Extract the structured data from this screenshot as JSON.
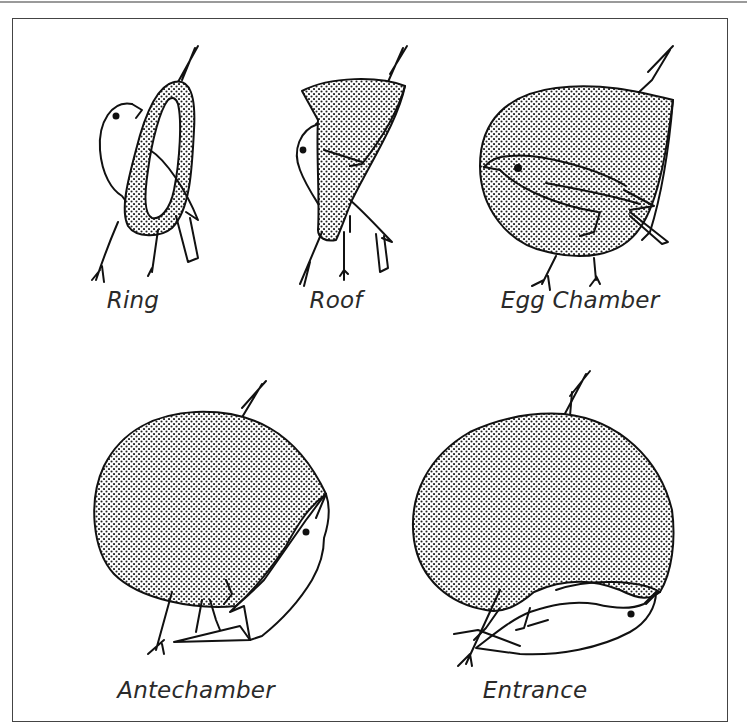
{
  "figure": {
    "panels": [
      {
        "id": "ring",
        "label": "Ring"
      },
      {
        "id": "roof",
        "label": "Roof"
      },
      {
        "id": "egg-chamber",
        "label": "Egg Chamber"
      },
      {
        "id": "antechamber",
        "label": "Antechamber"
      },
      {
        "id": "entrance",
        "label": "Entrance"
      }
    ],
    "colors": {
      "line": "#111111",
      "stipple": "#222222",
      "frame": "#444444",
      "rule": "#9a9a9a"
    }
  }
}
